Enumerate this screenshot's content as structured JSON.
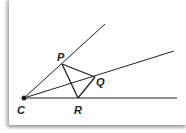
{
  "diagram": {
    "type": "geometry-angle-construction",
    "colors": {
      "line": "#231f20",
      "background": "#ffffff"
    },
    "points": {
      "C": {
        "label": "C",
        "x": 24,
        "y": 98
      },
      "P": {
        "label": "P",
        "x": 62,
        "y": 64
      },
      "Q": {
        "label": "Q",
        "x": 95,
        "y": 77
      },
      "R": {
        "label": "R",
        "x": 78,
        "y": 98
      }
    },
    "rays": [
      {
        "from": "C",
        "to_x": 105,
        "to_y": 24,
        "through": "P"
      },
      {
        "from": "C",
        "to_x": 174,
        "to_y": 51,
        "through": "Q"
      },
      {
        "from": "C",
        "to_x": 177,
        "to_y": 98,
        "through": "R"
      }
    ],
    "segments": [
      [
        "P",
        "Q"
      ],
      [
        "Q",
        "R"
      ],
      [
        "P",
        "R"
      ]
    ],
    "labels": {
      "C": "C",
      "P": "P",
      "Q": "Q",
      "R": "R"
    }
  }
}
